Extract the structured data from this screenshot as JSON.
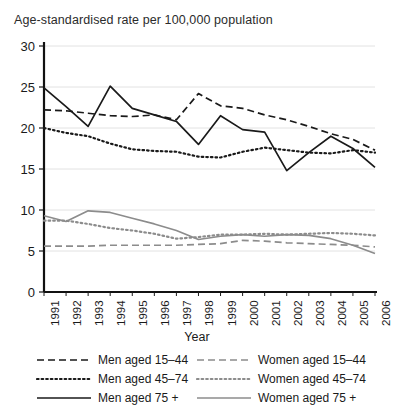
{
  "chart_data": {
    "type": "line",
    "title": "Age-standardised rate per 100,000 population",
    "xlabel": "Year",
    "ylabel": "",
    "xlim": [
      1991,
      2006
    ],
    "ylim": [
      0,
      30
    ],
    "yticks": [
      0,
      5,
      10,
      15,
      20,
      25,
      30
    ],
    "grid": true,
    "legend_position": "bottom",
    "categories": [
      1991,
      1992,
      1993,
      1994,
      1995,
      1996,
      1997,
      1998,
      1999,
      2000,
      2001,
      2002,
      2003,
      2004,
      2005,
      2006
    ],
    "xtick_labels": [
      "1991",
      "1992",
      "1993",
      "1994",
      "1995",
      "1996",
      "1997",
      "1998",
      "1999",
      "2000",
      "2001",
      "2002",
      "2003",
      "2004",
      "2005",
      "2006"
    ],
    "ytick_labels": [
      "0",
      "5",
      "10",
      "15",
      "20",
      "25",
      "30"
    ],
    "series": [
      {
        "name": "Men aged 15–44",
        "style": "dashed",
        "color": "#1a1a1a",
        "values": [
          22.2,
          22.1,
          21.8,
          21.5,
          21.4,
          21.6,
          21.0,
          24.2,
          22.7,
          22.4,
          21.6,
          21.0,
          20.2,
          19.3,
          18.6,
          17.3
        ]
      },
      {
        "name": "Men aged 45–74",
        "style": "dotted",
        "color": "#1a1a1a",
        "values": [
          20.0,
          19.4,
          19.0,
          18.1,
          17.4,
          17.2,
          17.1,
          16.5,
          16.4,
          17.1,
          17.6,
          17.3,
          17.0,
          16.9,
          17.3,
          17.0
        ]
      },
      {
        "name": "Men aged 75 +",
        "style": "solid",
        "color": "#1a1a1a",
        "values": [
          24.9,
          22.6,
          20.2,
          25.1,
          22.4,
          21.6,
          20.8,
          18.0,
          21.5,
          19.8,
          19.5,
          14.8,
          17.0,
          19.0,
          17.5,
          15.2
        ]
      },
      {
        "name": "Women aged 15–44",
        "style": "dashed",
        "color": "#8c8c8c",
        "values": [
          5.6,
          5.6,
          5.6,
          5.7,
          5.7,
          5.7,
          5.7,
          5.8,
          5.9,
          6.3,
          6.2,
          6.0,
          5.9,
          5.8,
          5.7,
          5.5
        ]
      },
      {
        "name": "Women aged 45–74",
        "style": "dotted",
        "color": "#8c8c8c",
        "values": [
          8.7,
          8.7,
          8.3,
          7.8,
          7.5,
          7.1,
          6.5,
          6.7,
          7.0,
          7.0,
          7.1,
          7.0,
          7.1,
          7.2,
          7.1,
          6.9
        ]
      },
      {
        "name": "Women aged 75 +",
        "style": "solid",
        "color": "#8c8c8c",
        "values": [
          9.3,
          8.6,
          9.9,
          9.7,
          9.0,
          8.3,
          7.5,
          6.4,
          6.8,
          7.0,
          6.8,
          7.0,
          6.9,
          6.5,
          5.7,
          4.7
        ]
      }
    ]
  },
  "legend": {
    "left": [
      {
        "label": "Men aged 15–44",
        "style": "dashed",
        "color": "#1a1a1a"
      },
      {
        "label": "Men aged 45–74",
        "style": "dotted",
        "color": "#1a1a1a"
      },
      {
        "label": "Men aged 75 +",
        "style": "solid",
        "color": "#1a1a1a"
      }
    ],
    "right": [
      {
        "label": "Women aged 15–44",
        "style": "dashed",
        "color": "#8c8c8c"
      },
      {
        "label": "Women aged 45–74",
        "style": "dotted",
        "color": "#8c8c8c"
      },
      {
        "label": "Women aged 75 +",
        "style": "solid",
        "color": "#8c8c8c"
      }
    ]
  }
}
